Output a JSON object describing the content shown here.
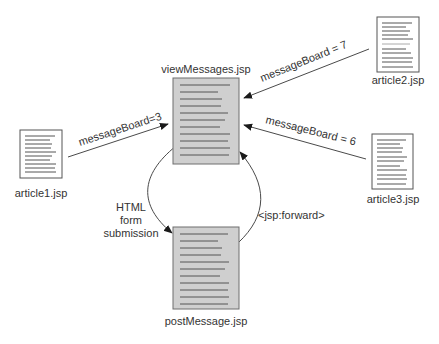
{
  "diagram": {
    "colors": {
      "main_fill": "#cfcfcf",
      "main_stroke": "#6e6e6e",
      "side_fill": "#ffffff",
      "side_stroke": "#555555",
      "line_color": "#4a4a4a",
      "text_color": "#333333"
    },
    "nodes": [
      {
        "id": "viewMessages",
        "label": "viewMessages.jsp",
        "kind": "main",
        "x": 173,
        "y": 78,
        "w": 66,
        "h": 86,
        "lines": 11,
        "label_x": 206,
        "label_y": 73
      },
      {
        "id": "postMessage",
        "label": "postMessage.jsp",
        "kind": "main",
        "x": 173,
        "y": 200,
        "w": 66,
        "h": 108,
        "lines": 11,
        "label_x": 206,
        "label_y": 325
      },
      {
        "id": "article1",
        "label": "article1.jsp",
        "kind": "side",
        "x": 20,
        "y": 130,
        "w": 42,
        "h": 42,
        "lines": 9,
        "label_x": 41,
        "label_y": 196
      },
      {
        "id": "article2",
        "label": "article2.jsp",
        "kind": "side",
        "x": 377,
        "y": 17,
        "w": 42,
        "h": 55,
        "lines": 10,
        "label_x": 397,
        "label_y": 83
      },
      {
        "id": "article3",
        "label": "article3.jsp",
        "kind": "side",
        "x": 372,
        "y": 134,
        "w": 41,
        "h": 56,
        "lines": 10,
        "label_x": 393,
        "label_y": 202
      }
    ],
    "edges": [
      {
        "id": "article1-to-view",
        "from": "article1",
        "to": "viewMessages",
        "label": "messageBoard=3",
        "x1": 68,
        "y1": 157,
        "x2": 168,
        "y2": 124,
        "label_x": 78,
        "label_y": 146,
        "label_rotate": -18
      },
      {
        "id": "article2-to-view",
        "from": "article2",
        "to": "viewMessages",
        "label": "messageBoard = 7",
        "x1": 369,
        "y1": 49,
        "x2": 244,
        "y2": 98,
        "label_x": 264,
        "label_y": 82,
        "label_rotate": -22
      },
      {
        "id": "article3-to-view",
        "from": "article3",
        "to": "viewMessages",
        "label": "messageBoard = 6",
        "x1": 366,
        "y1": 159,
        "x2": 244,
        "y2": 125,
        "label_x": 265,
        "label_y": 123,
        "label_rotate": 14
      },
      {
        "id": "view-to-post",
        "from": "viewMessages",
        "to": "postMessage",
        "label_lines": [
          "HTML",
          "form",
          "submission"
        ],
        "label_x": 131,
        "label_y": 211,
        "kind": "curve-left"
      },
      {
        "id": "post-to-view",
        "from": "postMessage",
        "to": "viewMessages",
        "label": "<jsp:forward>",
        "label_x": 259,
        "label_y": 219,
        "kind": "curve-right"
      }
    ]
  }
}
